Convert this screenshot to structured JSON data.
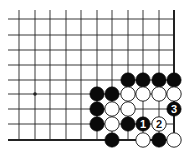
{
  "diagram": {
    "type": "go-board-partial",
    "colors": {
      "background": "#ffffff",
      "line": "#222222",
      "black_stone": "#0a0a0a",
      "white_stone": "#ffffff",
      "stone_outline": "#111111"
    },
    "grid": {
      "columns_x": [
        19,
        35,
        50,
        66,
        81,
        97,
        112,
        128,
        143,
        159,
        174
      ],
      "rows_y": [
        19,
        35,
        50,
        65,
        80,
        94,
        109,
        124,
        140
      ],
      "open_left_x": 8,
      "open_top_y": 10,
      "edges": [
        "right",
        "bottom"
      ]
    },
    "star_points": [
      {
        "col": 1,
        "row": 5
      }
    ],
    "stones": [
      {
        "col": 7,
        "row": 4,
        "color": "black"
      },
      {
        "col": 8,
        "row": 4,
        "color": "black"
      },
      {
        "col": 9,
        "row": 4,
        "color": "black"
      },
      {
        "col": 10,
        "row": 4,
        "color": "black"
      },
      {
        "col": 5,
        "row": 5,
        "color": "black"
      },
      {
        "col": 6,
        "row": 5,
        "color": "black"
      },
      {
        "col": 7,
        "row": 5,
        "color": "white"
      },
      {
        "col": 8,
        "row": 5,
        "color": "white"
      },
      {
        "col": 9,
        "row": 5,
        "color": "white"
      },
      {
        "col": 10,
        "row": 5,
        "color": "white"
      },
      {
        "col": 5,
        "row": 6,
        "color": "black"
      },
      {
        "col": 6,
        "row": 6,
        "color": "white"
      },
      {
        "col": 7,
        "row": 6,
        "color": "white"
      },
      {
        "col": 10,
        "row": 6,
        "color": "black",
        "label": "3"
      },
      {
        "col": 5,
        "row": 7,
        "color": "black"
      },
      {
        "col": 6,
        "row": 7,
        "color": "white"
      },
      {
        "col": 7,
        "row": 7,
        "color": "black"
      },
      {
        "col": 8,
        "row": 7,
        "color": "black",
        "label": "1"
      },
      {
        "col": 9,
        "row": 7,
        "color": "white",
        "label": "2"
      },
      {
        "col": 6,
        "row": 8,
        "color": "black"
      },
      {
        "col": 8,
        "row": 8,
        "color": "white"
      },
      {
        "col": 9,
        "row": 8,
        "color": "black"
      },
      {
        "col": 10,
        "row": 8,
        "color": "white"
      }
    ],
    "move_labels": [
      "1",
      "2",
      "3"
    ]
  }
}
